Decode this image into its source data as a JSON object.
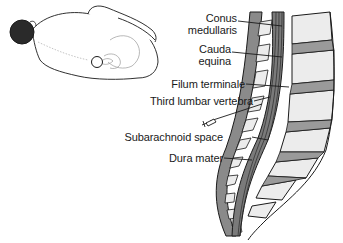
{
  "diagram": {
    "patient_figure": "patient lying on side, curled, with puncture site marked on lower back",
    "labels": [
      {
        "id": "conus",
        "line1": "Conus",
        "line2": "medullaris"
      },
      {
        "id": "cauda",
        "line1": "Cauda",
        "line2": "equina"
      },
      {
        "id": "filum",
        "text": "Filum terminale"
      },
      {
        "id": "third-lumbar",
        "text": "Third lumbar vertebra"
      },
      {
        "id": "subarachnoid",
        "text": "Subarachnoid space"
      },
      {
        "id": "dura",
        "text": "Dura mater"
      }
    ],
    "colors": {
      "outline": "#1a1a1a",
      "gray_fill": "#8a8a8a",
      "bone_fill": "#ececec",
      "hair": "#2a2a2a"
    }
  }
}
